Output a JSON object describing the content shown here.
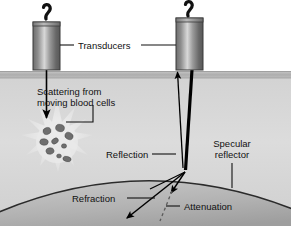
{
  "figure": {
    "width": 291,
    "height": 226,
    "background_color": "#ffffff"
  },
  "labels": {
    "transducers": "Transducers",
    "scattering_line1": "Scattering from",
    "scattering_line2": "moving blood cells",
    "reflection": "Reflection",
    "specular_line1": "Specular",
    "specular_line2": "reflector",
    "refraction": "Refraction",
    "attenuation": "Attenuation"
  },
  "colors": {
    "tissue_light": "#dcdcdc",
    "tissue_mid": "#c9c9c9",
    "skin_band": "#b5b5b5",
    "reflector_fill": "#b4b4b4",
    "transducer_dark": "#5a5a5a",
    "transducer_light": "#d4d4d4",
    "cell": "#6e6e6e",
    "ray": "#000000",
    "text": "#111111",
    "starburst": "#e8e8e8"
  },
  "elements": {
    "transducer_left": {
      "x": 33,
      "y": 22,
      "w": 27,
      "h": 48
    },
    "transducer_right": {
      "x": 176,
      "y": 18,
      "w": 27,
      "h": 52
    },
    "skin_surface_y": 73,
    "scatter_center": {
      "x": 57,
      "y": 143
    },
    "reflection_point": {
      "x": 185,
      "y": 172
    }
  },
  "blood_cells": [
    {
      "cx": 47,
      "cy": 131,
      "rx": 4.0,
      "ry": 3.4,
      "rot": -18
    },
    {
      "cx": 60,
      "cy": 128,
      "rx": 4.4,
      "ry": 3.6,
      "rot": 12
    },
    {
      "cx": 69,
      "cy": 136,
      "rx": 4.2,
      "ry": 3.4,
      "rot": 26
    },
    {
      "cx": 44,
      "cy": 142,
      "rx": 4.2,
      "ry": 3.2,
      "rot": 8
    },
    {
      "cx": 55,
      "cy": 141,
      "rx": 3.6,
      "ry": 2.6,
      "rot": -35
    },
    {
      "cx": 64,
      "cy": 146,
      "rx": 2.6,
      "ry": 2.2,
      "rot": 0
    },
    {
      "cx": 50,
      "cy": 151,
      "rx": 4.0,
      "ry": 3.2,
      "rot": -10
    },
    {
      "cx": 59,
      "cy": 156,
      "rx": 2.4,
      "ry": 2.0,
      "rot": 0
    },
    {
      "cx": 67,
      "cy": 159,
      "rx": 4.2,
      "ry": 2.6,
      "rot": 14
    }
  ]
}
